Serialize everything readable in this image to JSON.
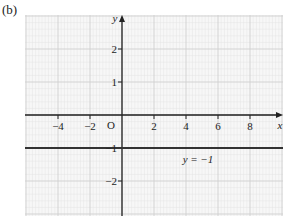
{
  "panel_label": "(b)",
  "chart_data": {
    "type": "line",
    "title": "",
    "xlabel": "x",
    "ylabel": "y",
    "origin_label": "O",
    "xlim": [
      -6,
      10
    ],
    "ylim": [
      -3,
      3
    ],
    "x_ticks": [
      -4,
      -2,
      2,
      4,
      6,
      8
    ],
    "x_tick_labels": [
      "−4",
      "−2",
      "2",
      "4",
      "6",
      "8"
    ],
    "y_ticks": [
      2,
      1,
      -1,
      -2
    ],
    "y_tick_labels": [
      "2",
      "1",
      "−1",
      "−2"
    ],
    "grid": true,
    "series": [
      {
        "name": "y = −1",
        "type": "horizontal_line",
        "y": -1,
        "x": [
          -6,
          10
        ],
        "values": [
          -1,
          -1
        ]
      }
    ],
    "annotations": [
      {
        "text": "y = −1",
        "x": 4,
        "y": -1.25
      }
    ]
  }
}
